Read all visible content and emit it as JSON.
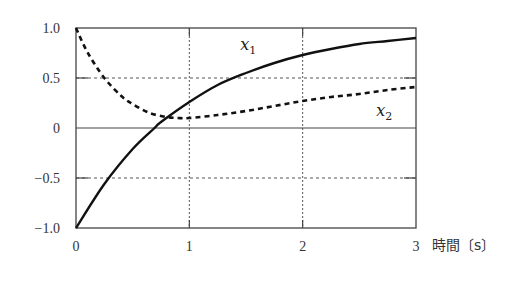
{
  "chart_data": {
    "type": "line",
    "title": "",
    "xlabel": "時間〔s〕",
    "ylabel": "",
    "xlim": [
      0,
      3
    ],
    "ylim": [
      -1.0,
      1.0
    ],
    "x_ticks": [
      "0",
      "1",
      "2",
      "3"
    ],
    "y_ticks": [
      "1.0",
      "0.5",
      "0",
      "−0.5",
      "−1.0"
    ],
    "grid": true,
    "legend": "inline labels",
    "series": [
      {
        "name": "x1",
        "style": "solid",
        "x": [
          0,
          0.25,
          0.5,
          0.693,
          0.75,
          1.0,
          1.25,
          1.5,
          1.75,
          2.0,
          2.25,
          2.5,
          2.75,
          3.0
        ],
        "values": [
          -1.0,
          -0.56,
          -0.21,
          0.0,
          0.06,
          0.26,
          0.43,
          0.55,
          0.65,
          0.73,
          0.79,
          0.84,
          0.87,
          0.9
        ]
      },
      {
        "name": "x2",
        "style": "dashed",
        "x": [
          0,
          0.1,
          0.25,
          0.4,
          0.5,
          0.65,
          0.8,
          0.9,
          1.0,
          1.25,
          1.5,
          1.75,
          2.0,
          2.25,
          2.5,
          2.75,
          3.0
        ],
        "values": [
          1.0,
          0.76,
          0.5,
          0.32,
          0.24,
          0.15,
          0.11,
          0.1,
          0.1,
          0.13,
          0.17,
          0.22,
          0.27,
          0.31,
          0.34,
          0.38,
          0.41
        ]
      }
    ],
    "annotations": [
      {
        "text": "x",
        "sub": "1",
        "x": 1.45,
        "y": 0.78
      },
      {
        "text": "x",
        "sub": "2",
        "x": 2.65,
        "y": 0.12
      }
    ]
  }
}
